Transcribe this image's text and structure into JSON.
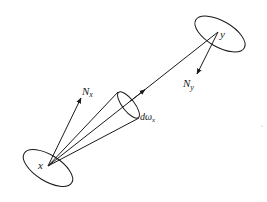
{
  "diagram": {
    "type": "geometry-radiance",
    "colors": {
      "stroke": "#1a1a1a",
      "background": "#ffffff"
    },
    "points": {
      "x": {
        "label": "x"
      },
      "y": {
        "label": "y"
      }
    },
    "normals": {
      "nx": {
        "label": "N",
        "sub": "x"
      },
      "ny": {
        "label": "N",
        "sub": "y"
      }
    },
    "solid_angle": {
      "label": "dω",
      "sub": "x"
    }
  }
}
